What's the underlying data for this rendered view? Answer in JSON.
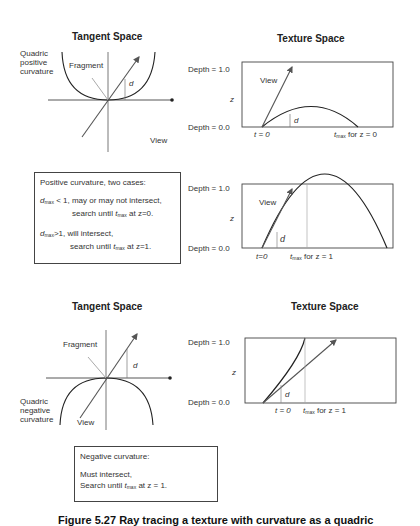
{
  "figure": {
    "caption": "Figure 5.27 Ray tracing a texture with curvature as a quadric"
  },
  "panels": {
    "top_left": {
      "title": "Tangent Space",
      "quadric_label": [
        "Quadric",
        "positive",
        "curvature"
      ],
      "fragment_label": "Fragment",
      "view_label": "View",
      "d_label": "d"
    },
    "top_right": {
      "title": "Texture Space",
      "depth_top": "Depth = 1.0",
      "z_label": "z",
      "depth_bottom": "Depth = 0.0",
      "view_label": "View",
      "d_label": "d",
      "t0_label": "t = 0",
      "tmax_label": "t",
      "tmax_sub": "max",
      "tmax_suffix": " for z = 0"
    },
    "middle_right": {
      "depth_top": "Depth = 1.0",
      "z_label": "z",
      "depth_bottom": "Depth = 0.0",
      "view_label": "View",
      "d_label": "d",
      "t0_label": "t=0",
      "tmax_label": "t",
      "tmax_sub": "max",
      "tmax_suffix": " for z = 1"
    },
    "positive_box": {
      "heading": "Positive curvature, two cases:",
      "case1_var": "d",
      "case1_sub": "max",
      "case1_line1": " < 1, may or may not intersect,",
      "case1_line2_pre": "search until ",
      "case1_line2_t": "t",
      "case1_line2_sub": "max",
      "case1_line2_post": " at z=0.",
      "case2_var": "d",
      "case2_sub": "max",
      "case2_line1": ">1, will intersect,",
      "case2_line2_pre": "search until ",
      "case2_line2_t": "t",
      "case2_line2_sub": "max",
      "case2_line2_post": " at z=1."
    },
    "bottom_left": {
      "title": "Tangent Space",
      "quadric_label": [
        "Quadric",
        "negative",
        "curvature"
      ],
      "fragment_label": "Fragment",
      "view_label": "View",
      "d_label": "d"
    },
    "bottom_right": {
      "title": "Texture Space",
      "depth_top": "Depth = 1.0",
      "z_label": "z",
      "depth_bottom": "Depth = 0.0",
      "d_label": "d",
      "t0_label": "t = 0",
      "tmax_label": "t",
      "tmax_sub": "max",
      "tmax_suffix": " for z = 1"
    },
    "negative_box": {
      "heading": "Negative curvature:",
      "line1": "Must intersect,",
      "line2_pre": "Search until ",
      "line2_t": "t",
      "line2_sub": "max",
      "line2_post": " at z = 1."
    }
  },
  "colors": {
    "curve": "#222222",
    "arrow": "#555555",
    "axis": "#444444",
    "fragment": "#aaaaaa"
  }
}
